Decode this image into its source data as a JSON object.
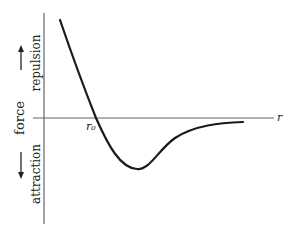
{
  "diagram": {
    "type": "interatomic force vs distance curve",
    "y_axis_label": "force",
    "upper_label": "repulsion",
    "lower_label": "attraction",
    "x_axis_label": "r",
    "crossing_label": "r₀",
    "colors": {
      "curve": "#1a1a1a",
      "axis": "#555555",
      "text": "#222222"
    }
  }
}
